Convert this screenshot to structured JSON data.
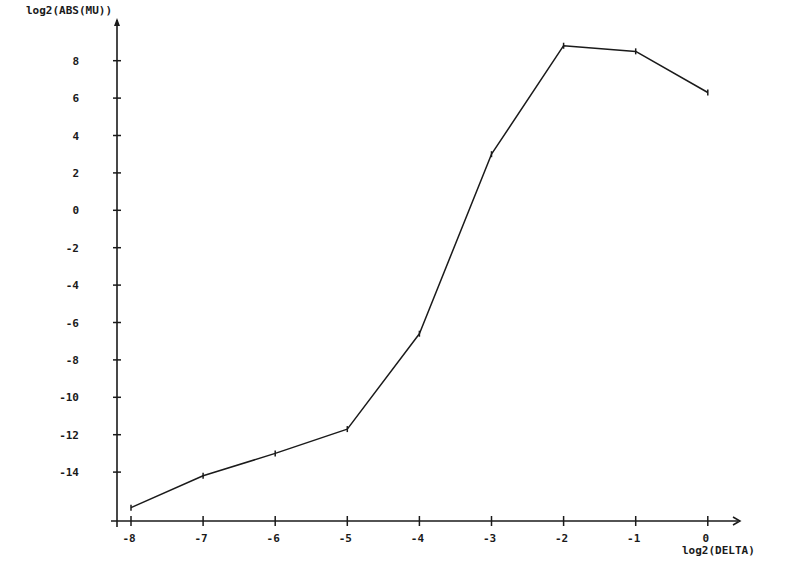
{
  "chart_data": {
    "type": "line",
    "title": "",
    "xlabel": "log2(DELTA)",
    "ylabel": "log2(ABS(MU))",
    "x": [
      -8,
      -7,
      -6,
      -5,
      -4,
      -3,
      -2,
      -1,
      0
    ],
    "series": [
      {
        "name": "log2(ABS(MU))",
        "values": [
          -15.9,
          -14.2,
          -13.0,
          -11.7,
          -6.6,
          3.0,
          8.8,
          8.5,
          6.3
        ]
      }
    ],
    "xticks": [
      -8,
      -7,
      -6,
      -5,
      -4,
      -3,
      -2,
      -1,
      0
    ],
    "yticks": [
      8,
      6,
      4,
      2,
      0,
      -2,
      -4,
      -6,
      -8,
      -10,
      -12,
      -14
    ],
    "xlim": [
      -8.2,
      0.4
    ],
    "ylim": [
      -16.6,
      9.5
    ],
    "grid": false,
    "legend": "none",
    "line_color": "#1a1a1a"
  },
  "axes": {
    "x_label": "log2(DELTA)",
    "y_label": "log2(ABS(MU))"
  }
}
